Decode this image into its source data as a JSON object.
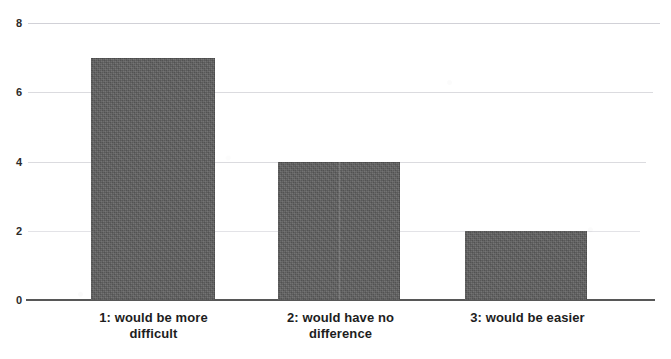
{
  "chart_data": {
    "type": "bar",
    "title": "",
    "subtitle": "",
    "xlabel": "",
    "ylabel": "",
    "categories": [
      "1:  would be more difficult",
      "2: would have no difference",
      "3: would be easier"
    ],
    "category_lines": [
      [
        "1:  would be more",
        "difficult"
      ],
      [
        "2: would have no",
        "difference"
      ],
      [
        "3: would be easier",
        ""
      ]
    ],
    "values": [
      7,
      4,
      2
    ],
    "ylim": [
      0,
      8
    ],
    "yticks": [
      "0",
      "2",
      "4",
      "6",
      "8"
    ],
    "grid": true,
    "legend": "none",
    "colors": {
      "bar_fill": "#5e5e5e",
      "gridline": "#5a5a6e",
      "axis": "#3a3a3a",
      "text": "#1d1d1d",
      "background": "#ffffff"
    }
  },
  "axis": {
    "y": {
      "tick_8": "8",
      "tick_6": "6",
      "tick_4": "4",
      "tick_2": "2",
      "tick_0": "0"
    }
  },
  "labels": {
    "cat0_line1": "1:  would be more",
    "cat0_line2": "difficult",
    "cat1_line1": "2: would have no",
    "cat1_line2": "difference",
    "cat2_line1": "3: would be easier"
  }
}
